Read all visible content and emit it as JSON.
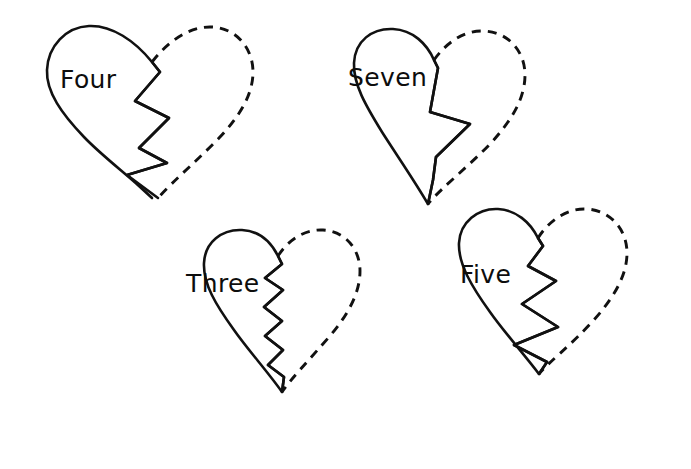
{
  "page": {
    "background_color": "#ffffff",
    "ink_color": "#111111",
    "width": 691,
    "height": 469
  },
  "hearts": [
    {
      "id": "heart-four",
      "label": "Four",
      "label_x": 60,
      "label_y": 88,
      "position": "top-left",
      "solid_half": "left",
      "dashed_half": "right",
      "solid_path": "M 152 198 C 132 178 104 158 84 137 C 62 114 46 92 47 70 C 48 46 66 27 89 26 C 112 25 135 41 152 62 L 160 72 L 135 101 L 169 118 L 139 148 L 167 163 L 127 175 Z",
      "crack_path": "M 152 62 L 160 72 L 135 101 L 169 118 L 139 148 L 167 163 L 127 175 L 158 198",
      "dashed_path": "M 152 62 C 168 41 190 26 212 27 C 236 28 253 48 253 72 C 253 95 239 117 219 138 C 198 160 174 180 158 198"
    },
    {
      "id": "heart-seven",
      "label": "Seven",
      "label_x": 348,
      "label_y": 86,
      "position": "top-right",
      "solid_half": "left",
      "dashed_half": "right",
      "solid_path": "M 428 204 C 414 180 396 154 382 132 C 366 106 353 84 354 63 C 355 41 372 28 393 29 C 413 30 427 44 434 60 L 438 68 L 430 112 L 470 124 L 436 157 L 433 180 Z",
      "crack_path": "M 434 60 L 438 68 L 430 112 L 470 124 L 436 157 L 433 180 L 428 204",
      "dashed_path": "M 434 60 C 446 43 464 30 484 31 C 508 32 525 51 525 75 C 525 99 511 121 491 143 C 468 167 441 188 428 204"
    },
    {
      "id": "heart-three",
      "label": "Three",
      "label_x": 186,
      "label_y": 292,
      "position": "bottom-left",
      "solid_half": "left",
      "dashed_half": "right",
      "solid_path": "M 282 392 C 268 372 248 350 234 330 C 216 305 203 284 204 263 C 205 242 222 229 242 230 C 259 231 271 242 278 256 L 282 264 L 265 278 L 283 290 L 264 307 L 282 321 L 265 336 L 283 350 L 268 365 L 284 377 Z",
      "crack_path": "M 278 256 L 282 264 L 265 278 L 283 290 L 264 307 L 282 321 L 265 336 L 283 350 L 268 365 L 284 377 L 282 392",
      "dashed_path": "M 278 256 C 288 240 305 229 323 230 C 345 231 360 249 360 271 C 360 294 347 316 329 337 C 309 360 291 379 282 392"
    },
    {
      "id": "heart-five",
      "label": "Five",
      "label_x": 460,
      "label_y": 283,
      "position": "bottom-right",
      "solid_half": "left",
      "dashed_half": "right",
      "solid_path": "M 539 374 C 524 354 504 332 490 312 C 472 287 458 264 459 243 C 460 222 478 208 498 209 C 516 210 530 222 538 238 L 543 246 L 528 266 L 556 281 L 522 304 L 558 327 L 514 345 L 547 362 Z",
      "crack_path": "M 538 238 L 543 246 L 528 266 L 556 281 L 522 304 L 558 327 L 514 345 L 547 362 L 539 374",
      "dashed_path": "M 538 238 C 548 222 566 208 586 209 C 610 210 627 229 627 253 C 627 277 612 300 592 322 C 570 346 549 362 539 374"
    }
  ]
}
